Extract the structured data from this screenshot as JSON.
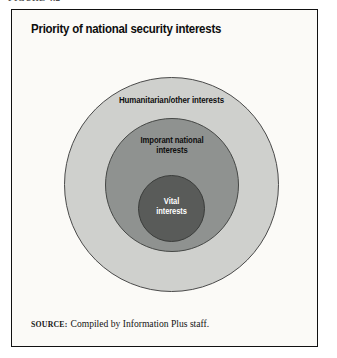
{
  "figure": {
    "caption_label": "FIGURE 4.2",
    "title": "Priority of national security interests",
    "source_label": "SOURCE:",
    "source_text": "Compiled by Information Plus staff."
  },
  "colors": {
    "page_background": "#ffffff",
    "box_background": "#fbfaf7",
    "box_border": "#111111",
    "outer_ring": "#cfd0cd",
    "middle_ring": "#8f9290",
    "inner_ring": "#595b59",
    "ring_outline": "#4a4a4a",
    "dark_label_text": "#0e0e0e",
    "light_label_text": "#ffffff"
  },
  "chart_data": {
    "type": "diagram",
    "subtype": "concentric-circles",
    "title": "Priority of national security interests",
    "center": {
      "x": 171,
      "y": 183
    },
    "rings": [
      {
        "rank": 3,
        "priority": "lowest",
        "label": "Humanitarian/other interests",
        "label_lines": "Humanitarian/other interests",
        "fill": "#cfd0cd",
        "text_color": "#0e0e0e",
        "diameter": 215,
        "radius": 107.5,
        "label_position": "top-inside"
      },
      {
        "rank": 2,
        "priority": "middle",
        "label": "Imporant national interests",
        "label_lines": "Imporant national\ninterests",
        "fill": "#8f9290",
        "text_color": "#0e0e0e",
        "diameter": 134,
        "radius": 67,
        "label_position": "top-inside"
      },
      {
        "rank": 1,
        "priority": "highest",
        "label": "Vital interests",
        "label_lines": "Vital\ninterests",
        "fill": "#595b59",
        "text_color": "#ffffff",
        "diameter": 67,
        "radius": 33.5,
        "label_position": "center"
      }
    ],
    "legend": null,
    "grid": false,
    "xlabel": "",
    "ylabel": ""
  }
}
